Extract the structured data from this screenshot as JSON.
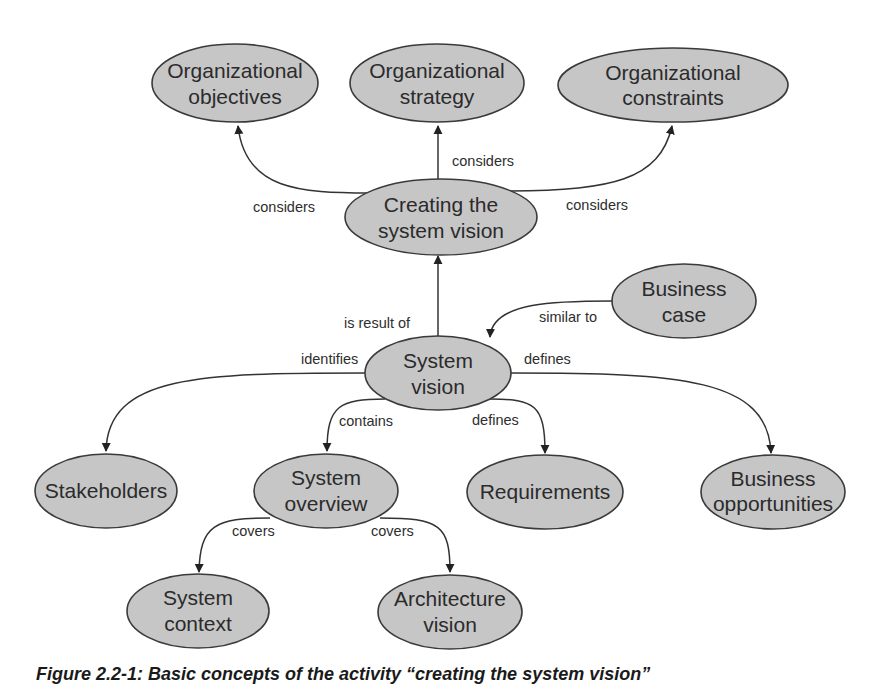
{
  "diagram": {
    "type": "concept-map",
    "colors": {
      "node_fill": "#c6c6c6",
      "node_stroke": "#3a3a3a",
      "edge": "#333333",
      "text": "#2b2b2b",
      "background": "#ffffff"
    },
    "nodes": {
      "org_objectives": {
        "lines": [
          "Organizational",
          "objectives"
        ]
      },
      "org_strategy": {
        "lines": [
          "Organizational",
          "strategy"
        ]
      },
      "org_constraints": {
        "lines": [
          "Organizational",
          "constraints"
        ]
      },
      "creating_vision": {
        "lines": [
          "Creating the",
          "system vision"
        ]
      },
      "business_case": {
        "lines": [
          "Business",
          "case"
        ]
      },
      "system_vision": {
        "lines": [
          "System",
          "vision"
        ]
      },
      "stakeholders": {
        "lines": [
          "Stakeholders"
        ]
      },
      "system_overview": {
        "lines": [
          "System",
          "overview"
        ]
      },
      "requirements": {
        "lines": [
          "Requirements"
        ]
      },
      "business_opportunities": {
        "lines": [
          "Business",
          "opportunities"
        ]
      },
      "system_context": {
        "lines": [
          "System",
          "context"
        ]
      },
      "architecture_vision": {
        "lines": [
          "Architecture",
          "vision"
        ]
      }
    },
    "edges": [
      {
        "from": "creating_vision",
        "to": "org_objectives",
        "label": "considers"
      },
      {
        "from": "creating_vision",
        "to": "org_strategy",
        "label": "considers"
      },
      {
        "from": "creating_vision",
        "to": "org_constraints",
        "label": "considers"
      },
      {
        "from": "system_vision",
        "to": "creating_vision",
        "label": "is result of"
      },
      {
        "from": "business_case",
        "to": "system_vision",
        "label": "similar to"
      },
      {
        "from": "system_vision",
        "to": "stakeholders",
        "label": "identifies"
      },
      {
        "from": "system_vision",
        "to": "business_opportunities",
        "label": "defines"
      },
      {
        "from": "system_vision",
        "to": "system_overview",
        "label": "contains"
      },
      {
        "from": "system_vision",
        "to": "requirements",
        "label": "defines"
      },
      {
        "from": "system_overview",
        "to": "system_context",
        "label": "covers"
      },
      {
        "from": "system_overview",
        "to": "architecture_vision",
        "label": "covers"
      }
    ]
  },
  "caption": "Figure 2.2-1: Basic concepts of the activity “creating the system vision”"
}
